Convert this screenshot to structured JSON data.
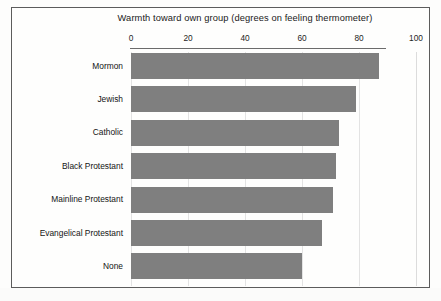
{
  "figure": {
    "background_color": "#fdfdfc",
    "frame_color": "#5c5c5c",
    "bar_color": "#7f7f7f",
    "grid_color": "#e3e3e3"
  },
  "chart_data": {
    "type": "bar",
    "orientation": "horizontal",
    "title": "Warmth toward own group (degrees on feeling thermometer)",
    "xlabel": "",
    "ylabel": "",
    "xlim": [
      0,
      100
    ],
    "xticks": [
      0,
      20,
      40,
      60,
      80,
      100
    ],
    "xtick_labels": [
      "0",
      "20",
      "40",
      "60",
      "80",
      "100"
    ],
    "grid": true,
    "grid_axis": "x",
    "legend": false,
    "categories": [
      "Mormon",
      "Jewish",
      "Catholic",
      "Black Protestant",
      "Mainline Protestant",
      "Evangelical Protestant",
      "None"
    ],
    "values": [
      87,
      79,
      73,
      72,
      71,
      67,
      60
    ],
    "series": [
      {
        "name": "Warmth toward own group",
        "color": "#7f7f7f",
        "values": [
          87,
          79,
          73,
          72,
          71,
          67,
          60
        ]
      }
    ]
  }
}
